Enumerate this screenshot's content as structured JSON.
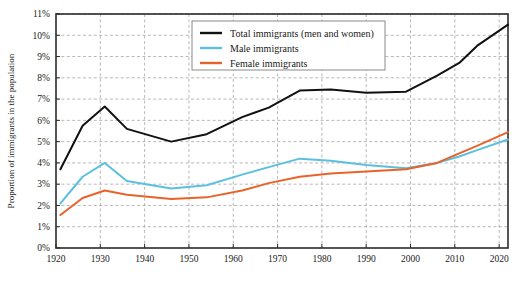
{
  "chart_data": {
    "type": "line",
    "title": "",
    "xlabel": "",
    "ylabel": "Proportion of immigrants in the population",
    "xlim": [
      1920,
      2022
    ],
    "ylim": [
      0,
      11
    ],
    "grid": true,
    "legend_position": "top-center",
    "y_tick_labels": [
      "0%",
      "1%",
      "2%",
      "3%",
      "4%",
      "5%",
      "6%",
      "7%",
      "8%",
      "9%",
      "10%",
      "11%"
    ],
    "y_tick_values": [
      0,
      1,
      2,
      3,
      4,
      5,
      6,
      7,
      8,
      9,
      10,
      11
    ],
    "x_tick_labels": [
      "1920",
      "1930",
      "1940",
      "1950",
      "1960",
      "1970",
      "1980",
      "1990",
      "2000",
      "2010",
      "2020"
    ],
    "x_tick_values": [
      1920,
      1930,
      1940,
      1950,
      1960,
      1970,
      1980,
      1990,
      2000,
      2010,
      2020
    ],
    "series": [
      {
        "name": "Total immigrants (men and women)",
        "color": "#111111",
        "x": [
          1921,
          1926,
          1931,
          1936,
          1946,
          1954,
          1962,
          1968,
          1975,
          1982,
          1990,
          1999,
          2006,
          2011,
          2015,
          2022
        ],
        "values": [
          3.7,
          5.75,
          6.65,
          5.6,
          5.0,
          5.35,
          6.15,
          6.6,
          7.4,
          7.45,
          7.3,
          7.35,
          8.1,
          8.7,
          9.5,
          10.5
        ]
      },
      {
        "name": "Male immigrants",
        "color": "#5bc0de",
        "x": [
          1921,
          1926,
          1931,
          1936,
          1946,
          1954,
          1962,
          1968,
          1975,
          1982,
          1990,
          1999,
          2006,
          2011,
          2015,
          2022
        ],
        "values": [
          2.1,
          3.35,
          4.0,
          3.15,
          2.8,
          2.95,
          3.45,
          3.8,
          4.2,
          4.1,
          3.9,
          3.75,
          4.0,
          4.3,
          4.6,
          5.1
        ]
      },
      {
        "name": "Female immigrants",
        "color": "#e8632a",
        "x": [
          1921,
          1926,
          1931,
          1936,
          1946,
          1954,
          1962,
          1968,
          1975,
          1982,
          1990,
          1999,
          2006,
          2011,
          2015,
          2022
        ],
        "values": [
          1.55,
          2.35,
          2.7,
          2.5,
          2.3,
          2.38,
          2.7,
          3.05,
          3.35,
          3.5,
          3.6,
          3.7,
          4.0,
          4.45,
          4.8,
          5.45
        ]
      }
    ]
  },
  "legend": {
    "entries": [
      {
        "label": "Total immigrants (men and women)"
      },
      {
        "label": "Male immigrants"
      },
      {
        "label": "Female immigrants"
      }
    ]
  }
}
